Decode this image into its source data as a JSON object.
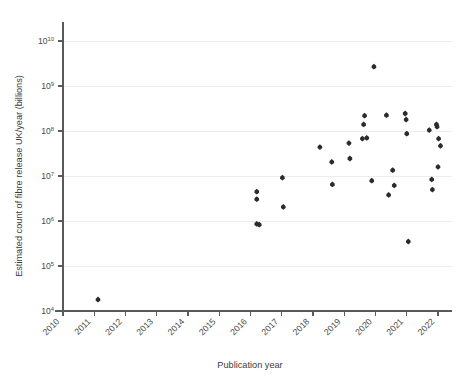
{
  "chart_data": {
    "type": "scatter",
    "title": "",
    "xlabel": "Publication year",
    "ylabel": "Estimated count of fibre release UK/year (billions)",
    "x_tick_labels": [
      "2010",
      "2011",
      "2012",
      "2013",
      "2014",
      "2015",
      "2016",
      "2017",
      "2018",
      "2019",
      "2020",
      "2021",
      "2022"
    ],
    "y_tick_labels": [
      "10⁴",
      "10⁵",
      "10⁶",
      "10⁷",
      "10⁸",
      "10⁹",
      "10¹⁰"
    ],
    "y_tick_mantissa": [
      "10",
      "10",
      "10",
      "10",
      "10",
      "10",
      "10"
    ],
    "y_tick_exponents": [
      "4",
      "5",
      "6",
      "7",
      "8",
      "9",
      "10"
    ],
    "y_tick_values": [
      10000,
      100000,
      1000000,
      10000000,
      100000000,
      1000000000,
      10000000000
    ],
    "yscale": "log",
    "xlim": [
      2010,
      2022.6
    ],
    "ylim": [
      10000,
      10000000000
    ],
    "grid": true,
    "grid_axis": "y",
    "legend": "none",
    "marker": "diamond",
    "marker_color": "#2b2b2b",
    "points": [
      {
        "x": 2011.12,
        "y": 18000
      },
      {
        "x": 2016.2,
        "y": 4500000
      },
      {
        "x": 2016.2,
        "y": 3050000
      },
      {
        "x": 2016.2,
        "y": 860000
      },
      {
        "x": 2016.28,
        "y": 830000
      },
      {
        "x": 2017.02,
        "y": 9200000
      },
      {
        "x": 2017.05,
        "y": 2050000
      },
      {
        "x": 2018.22,
        "y": 44000000
      },
      {
        "x": 2018.6,
        "y": 20500000
      },
      {
        "x": 2018.62,
        "y": 6500000
      },
      {
        "x": 2019.15,
        "y": 54000000
      },
      {
        "x": 2019.18,
        "y": 24500000
      },
      {
        "x": 2019.58,
        "y": 68000000
      },
      {
        "x": 2019.72,
        "y": 70000000
      },
      {
        "x": 2019.65,
        "y": 220000000
      },
      {
        "x": 2019.62,
        "y": 140000000
      },
      {
        "x": 2019.88,
        "y": 7900000
      },
      {
        "x": 2019.95,
        "y": 2700000000
      },
      {
        "x": 2020.35,
        "y": 225000000
      },
      {
        "x": 2020.42,
        "y": 3800000
      },
      {
        "x": 2020.55,
        "y": 13500000
      },
      {
        "x": 2020.6,
        "y": 6200000
      },
      {
        "x": 2020.95,
        "y": 245000000
      },
      {
        "x": 2020.98,
        "y": 180000000
      },
      {
        "x": 2021.0,
        "y": 87000000
      },
      {
        "x": 2021.05,
        "y": 350000
      },
      {
        "x": 2021.72,
        "y": 105000000
      },
      {
        "x": 2021.8,
        "y": 8400000
      },
      {
        "x": 2021.82,
        "y": 5000000
      },
      {
        "x": 2021.95,
        "y": 140000000
      },
      {
        "x": 2021.97,
        "y": 125000000
      },
      {
        "x": 2022.02,
        "y": 68000000
      },
      {
        "x": 2022.08,
        "y": 47000000
      },
      {
        "x": 2022.0,
        "y": 16000000
      }
    ]
  },
  "axes": {
    "x_axis_name": "publication-year-axis",
    "y_axis_name": "fibre-release-axis"
  }
}
